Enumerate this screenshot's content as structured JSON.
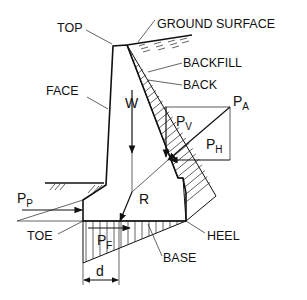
{
  "labels": {
    "top": "TOP",
    "ground_surface": "GROUND SURFACE",
    "backfill": "BACKFILL",
    "back": "BACK",
    "face": "FACE",
    "toe": "TOE",
    "heel": "HEEL",
    "base": "BASE"
  },
  "forces": {
    "weight": "W",
    "resultant": "R",
    "active_pressure": "P",
    "active_pressure_sub": "A",
    "vertical_component": "P",
    "vertical_component_sub": "V",
    "horizontal_component": "P",
    "horizontal_component_sub": "H",
    "passive_pressure": "P",
    "passive_pressure_sub": "P",
    "friction": "P",
    "friction_sub": "F"
  },
  "dimension": {
    "eccentricity": "d"
  },
  "colors": {
    "ink": "#111111",
    "background": "#ffffff"
  }
}
